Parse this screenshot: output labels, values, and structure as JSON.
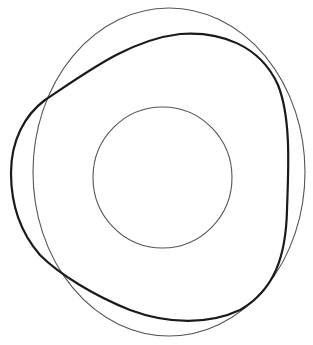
{
  "diagram": {
    "width": 313,
    "height": 345,
    "background": "#ffffff",
    "shapes": [
      {
        "id": "outer-ellipse",
        "type": "ellipse",
        "cx": 169,
        "cy": 172,
        "rx": 136,
        "ry": 164,
        "stroke": "#555555",
        "stroke_width": 1.1
      },
      {
        "id": "inner-circle",
        "type": "ellipse",
        "cx": 162.5,
        "cy": 177.5,
        "rx": 69.5,
        "ry": 70.5,
        "stroke": "#555555",
        "stroke_width": 1.1
      },
      {
        "id": "rounded-triangle-curve",
        "type": "path",
        "d": "M 11 173 C 11 140, 25 115, 45 100 C 90 70, 130 40, 180 34 C 220 31, 260 45, 278 85 C 292 120, 288 175, 287 210 C 286 255, 275 290, 240 310 C 210 324, 170 325, 130 310 C 95 296, 60 275, 40 255 C 20 232, 11 205, 11 173 Z",
        "stroke": "#1a1a1a",
        "stroke_width": 2.2
      }
    ]
  }
}
